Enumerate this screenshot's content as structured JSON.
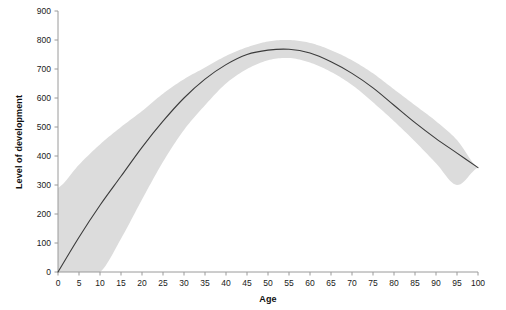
{
  "chart_data": {
    "type": "line",
    "title": "",
    "xlabel": "Age",
    "ylabel": "Level of development",
    "xlim": [
      0,
      100
    ],
    "ylim": [
      0,
      900
    ],
    "x_ticks": [
      0,
      5,
      10,
      15,
      20,
      25,
      30,
      35,
      40,
      45,
      50,
      55,
      60,
      65,
      70,
      75,
      80,
      85,
      90,
      95,
      100
    ],
    "y_ticks": [
      0,
      100,
      200,
      300,
      400,
      500,
      600,
      700,
      800,
      900
    ],
    "grid": false,
    "legend": "none",
    "colors": {
      "line": "#3b3b3b",
      "band": "#dcdcdc",
      "axis": "#9a9a9a",
      "text": "#1a1a1a"
    },
    "series": [
      {
        "name": "Level of development",
        "kind": "line",
        "x": [
          0,
          5,
          10,
          15,
          20,
          25,
          30,
          35,
          40,
          45,
          50,
          55,
          60,
          65,
          70,
          75,
          80,
          85,
          90,
          95,
          100
        ],
        "values": [
          0,
          120,
          230,
          330,
          430,
          520,
          600,
          665,
          715,
          750,
          765,
          768,
          755,
          725,
          685,
          635,
          575,
          515,
          460,
          410,
          360
        ]
      },
      {
        "name": "Confidence band upper",
        "kind": "band-upper",
        "x": [
          0,
          5,
          10,
          15,
          20,
          25,
          30,
          35,
          40,
          45,
          50,
          55,
          60,
          65,
          70,
          75,
          80,
          85,
          90,
          95,
          100
        ],
        "values": [
          290,
          370,
          440,
          500,
          555,
          615,
          665,
          705,
          745,
          775,
          795,
          800,
          790,
          765,
          730,
          685,
          630,
          575,
          520,
          455,
          360
        ]
      },
      {
        "name": "Confidence band lower",
        "kind": "band-lower",
        "x": [
          0,
          5,
          10,
          15,
          20,
          25,
          30,
          35,
          40,
          45,
          50,
          55,
          60,
          65,
          70,
          75,
          80,
          85,
          90,
          95,
          100
        ],
        "values": [
          0,
          0,
          0,
          115,
          250,
          380,
          490,
          575,
          650,
          700,
          730,
          738,
          722,
          690,
          645,
          585,
          520,
          450,
          375,
          300,
          360
        ]
      }
    ],
    "annotations": {
      "peak_age": 55,
      "peak_value": 768,
      "end_age": 100,
      "end_value": 360,
      "start_age": 0,
      "start_value": 0
    }
  }
}
